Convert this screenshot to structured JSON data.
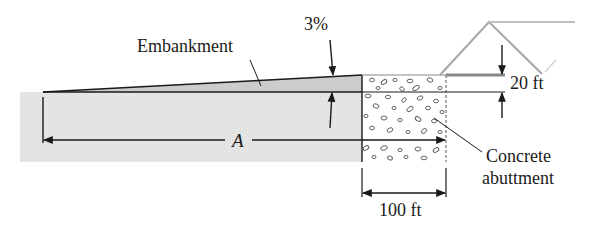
{
  "labels": {
    "embankment": "Embankment",
    "slope": "3%",
    "height": "20 ft",
    "distance": "A",
    "abutment_line1": "Concrete",
    "abutment_line2": "abuttment",
    "width": "100 ft"
  },
  "colors": {
    "ground": "#e4e4e4",
    "embankment": "#cfcfcf",
    "line": "#1a1a1a",
    "bridge": "#b0b0b0"
  }
}
